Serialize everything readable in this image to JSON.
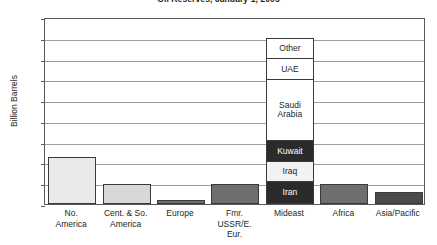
{
  "chart_data": {
    "type": "bar",
    "title": "Oil Reserves, January 1, 2005",
    "xlabel": "",
    "ylabel": "Billion Barrels",
    "ylim": [
      0,
      900
    ],
    "ytick_step": 100,
    "yticks": [
      "900",
      "800",
      "700",
      "600",
      "500",
      "400",
      "300",
      "200",
      "100",
      "0"
    ],
    "grid": true,
    "legend": "none",
    "categories": [
      "No. America",
      "Cent. & So. America",
      "Europe",
      "Fmr. USSR/E. Eur.",
      "Mideast",
      "Africa",
      "Asia/Pacific"
    ],
    "category_lines": [
      [
        "No.",
        "America"
      ],
      [
        "Cent. & So.",
        "America"
      ],
      [
        "Europe"
      ],
      [
        "Fmr.",
        "USSR/E.",
        "Eur."
      ],
      [
        "Mideast"
      ],
      [
        "Africa"
      ],
      [
        "Asia/Pacific"
      ]
    ],
    "values": [
      225,
      97,
      18,
      98,
      800,
      95,
      60
    ],
    "bar_colors": [
      "#e9e9e9",
      "#d8d8d8",
      "#6e6e6e",
      "#6e6e6e",
      "#ffffff",
      "#6e6e6e",
      "#4a4a4a"
    ],
    "stacked_bar": {
      "category": "Mideast",
      "total": 800,
      "segments_bottom_to_top": [
        {
          "label": "Iran",
          "value": 100,
          "color": "#2b2b2b",
          "text_color": "#ffffff"
        },
        {
          "label": "Iraq",
          "value": 100,
          "color": "#f2f2f2",
          "text_color": "#231f20"
        },
        {
          "label": "Kuwait",
          "value": 100,
          "color": "#2b2b2b",
          "text_color": "#ffffff"
        },
        {
          "label": "Saudi Arabia",
          "value": 300,
          "color": "#ffffff",
          "text_color": "#231f20"
        },
        {
          "label": "UAE",
          "value": 100,
          "color": "#ffffff",
          "text_color": "#231f20"
        },
        {
          "label": "Other",
          "value": 100,
          "color": "#ffffff",
          "text_color": "#231f20"
        }
      ]
    }
  }
}
